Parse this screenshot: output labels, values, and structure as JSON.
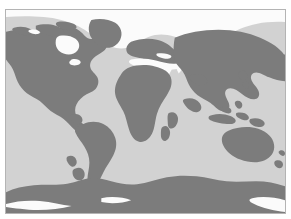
{
  "page": {
    "background_color": "#ffffff",
    "width": 291,
    "height": 219
  },
  "map": {
    "title": "",
    "projection": "equirectangular",
    "frame": {
      "border_color": "#b4b4b4",
      "border_width": 1,
      "x": 5,
      "y": 9,
      "width": 281,
      "height": 205
    },
    "colors": {
      "ocean": "#d2d2d2",
      "land": "#7c7c7c",
      "ice": "#fbfbfb",
      "outer_background": "#ffffff"
    },
    "regions": [
      {
        "name": "north-america",
        "fill": "land"
      },
      {
        "name": "greenland",
        "fill": "land"
      },
      {
        "name": "south-america",
        "fill": "land"
      },
      {
        "name": "europe",
        "fill": "land"
      },
      {
        "name": "africa",
        "fill": "land"
      },
      {
        "name": "asia",
        "fill": "land"
      },
      {
        "name": "australia",
        "fill": "land"
      },
      {
        "name": "antarctica",
        "fill": "land"
      },
      {
        "name": "arctic-sea-ice",
        "fill": "ice"
      },
      {
        "name": "mediterranean-sea",
        "fill": "ice"
      },
      {
        "name": "hudson-bay",
        "fill": "ice"
      },
      {
        "name": "ross-ice-shelf",
        "fill": "ice"
      }
    ],
    "graticule": {
      "visible": false,
      "lon_range": [
        -180,
        180
      ],
      "lat_range": [
        -90,
        90
      ]
    },
    "legend": {
      "visible": false,
      "entries": []
    },
    "labels": {
      "visible": false,
      "entries": []
    }
  }
}
